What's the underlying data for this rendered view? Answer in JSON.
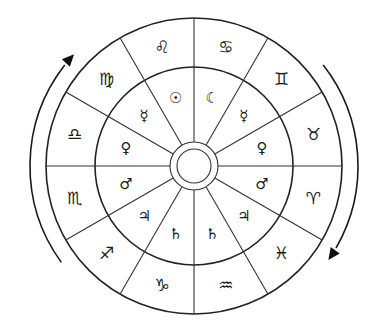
{
  "diagram": {
    "type": "zodiac-wheel",
    "center": [
      194,
      166
    ],
    "radii": {
      "outer": 148,
      "middle": 99,
      "hub_outer": 24,
      "hub_inner": 17
    },
    "sector_count": 12,
    "colors": {
      "stroke": "#222222",
      "background": "#ffffff"
    },
    "outer_ring_label": "zodiac signs",
    "inner_ring_label": "planetary rulers",
    "sectors": [
      {
        "angle": 15,
        "sign": "♋",
        "sign_name": "Cancer",
        "planet": "☾",
        "planet_name": "Moon"
      },
      {
        "angle": 45,
        "sign": "♊",
        "sign_name": "Gemini",
        "planet": "☿",
        "planet_name": "Mercury"
      },
      {
        "angle": 75,
        "sign": "♉",
        "sign_name": "Taurus",
        "planet": "♀",
        "planet_name": "Venus"
      },
      {
        "angle": 105,
        "sign": "♈",
        "sign_name": "Aries",
        "planet": "♂",
        "planet_name": "Mars"
      },
      {
        "angle": 135,
        "sign": "♓",
        "sign_name": "Pisces",
        "planet": "♃",
        "planet_name": "Jupiter"
      },
      {
        "angle": 165,
        "sign": "♒",
        "sign_name": "Aquarius",
        "planet": "♄",
        "planet_name": "Saturn"
      },
      {
        "angle": 195,
        "sign": "♑",
        "sign_name": "Capricorn",
        "planet": "♄",
        "planet_name": "Saturn"
      },
      {
        "angle": 225,
        "sign": "♐",
        "sign_name": "Sagittarius",
        "planet": "♃",
        "planet_name": "Jupiter"
      },
      {
        "angle": 255,
        "sign": "♏",
        "sign_name": "Scorpio",
        "planet": "♂",
        "planet_name": "Mars"
      },
      {
        "angle": 285,
        "sign": "♎",
        "sign_name": "Libra",
        "planet": "♀",
        "planet_name": "Venus"
      },
      {
        "angle": 315,
        "sign": "♍",
        "sign_name": "Virgo",
        "planet": "☿",
        "planet_name": "Mercury"
      },
      {
        "angle": 345,
        "sign": "♌",
        "sign_name": "Leo",
        "planet": "☉",
        "planet_name": "Sun"
      }
    ],
    "arrows": [
      {
        "side": "left",
        "direction": "up",
        "label": "counter-clockwise arrow"
      },
      {
        "side": "right",
        "direction": "down",
        "label": "clockwise arrow"
      }
    ]
  }
}
